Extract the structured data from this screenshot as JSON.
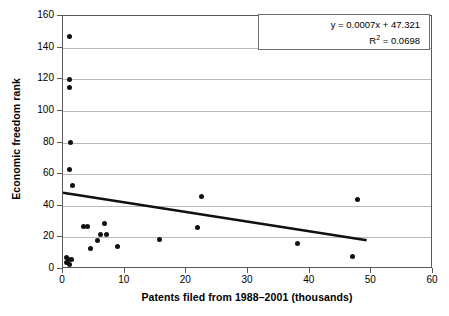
{
  "chart_data": {
    "type": "scatter",
    "title": "",
    "xlabel": "Patents filed from 1988–2001 (thousands)",
    "ylabel": "Economic freedom rank",
    "xlim": [
      0,
      60
    ],
    "ylim": [
      0,
      160
    ],
    "xticks": [
      0,
      10,
      20,
      30,
      40,
      50,
      60
    ],
    "yticks": [
      0,
      20,
      40,
      60,
      80,
      100,
      120,
      140,
      160
    ],
    "grid": "horizontal",
    "legend": "none",
    "marker_color": "#111111",
    "trendline_color": "#111111",
    "gridline_color": "#b9b9bb",
    "axis_color": "#59595b",
    "annotation": {
      "equation": "y =  0.0007x + 47.321",
      "r_squared_label": "R",
      "r_squared_sup": "2",
      "r_squared_value": "= 0.0698"
    },
    "trendline": {
      "x0": 0.0,
      "y0": 47.3,
      "x1": 49.5,
      "y1": 17.0
    },
    "points": [
      {
        "x": 1.0,
        "y": 147
      },
      {
        "x": 1.0,
        "y": 120
      },
      {
        "x": 1.0,
        "y": 115
      },
      {
        "x": 1.2,
        "y": 80
      },
      {
        "x": 1.0,
        "y": 63
      },
      {
        "x": 1.6,
        "y": 53
      },
      {
        "x": 22.5,
        "y": 46
      },
      {
        "x": 47.8,
        "y": 44
      },
      {
        "x": 21.8,
        "y": 26
      },
      {
        "x": 3.3,
        "y": 27
      },
      {
        "x": 4.0,
        "y": 27
      },
      {
        "x": 6.8,
        "y": 29
      },
      {
        "x": 6.0,
        "y": 22
      },
      {
        "x": 7.0,
        "y": 22
      },
      {
        "x": 5.6,
        "y": 18
      },
      {
        "x": 15.6,
        "y": 19
      },
      {
        "x": 38.0,
        "y": 16
      },
      {
        "x": 8.8,
        "y": 14
      },
      {
        "x": 4.4,
        "y": 13
      },
      {
        "x": 47.0,
        "y": 8
      },
      {
        "x": 0.5,
        "y": 7
      },
      {
        "x": 0.9,
        "y": 6
      },
      {
        "x": 1.3,
        "y": 6
      },
      {
        "x": 0.6,
        "y": 4
      },
      {
        "x": 1.1,
        "y": 3
      }
    ]
  }
}
